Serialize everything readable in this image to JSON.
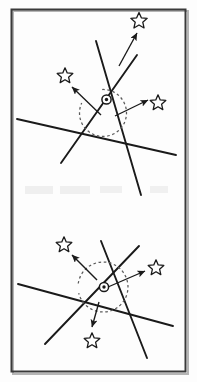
{
  "figure": {
    "canvas": {
      "width": 197,
      "height": 382
    },
    "background_color": "#fdfdfd",
    "stroke_color": "#1a1a1a",
    "frame": {
      "label": "outer-frame",
      "x": 11,
      "y": 9,
      "width": 175,
      "height": 363,
      "border_color": "#3a3a3a",
      "border_width": 2,
      "shadow_color": "#9a9a9a"
    },
    "panels": [
      {
        "name": "top-panel",
        "center_marker": {
          "label": "center-point-top",
          "cx": 106.5,
          "cy": 99.5,
          "outer_radius": 4.6,
          "inner_radius": 1.7
        },
        "dashed_arc": {
          "label": "dashed-circle-top",
          "cx": 103,
          "cy": 113,
          "radius": 23.5,
          "dash": "2.6 2.6",
          "color": "#5a5a5a",
          "start_angle_deg": -92,
          "end_angle_deg": 205
        },
        "lines": [
          {
            "label": "line-a",
            "x1": 96,
            "y1": 41,
            "x2": 141,
            "y2": 195
          },
          {
            "label": "line-b",
            "x1": 137,
            "y1": 55,
            "x2": 61,
            "y2": 163
          },
          {
            "label": "line-c",
            "x1": 17,
            "y1": 119,
            "x2": 176,
            "y2": 155
          }
        ],
        "arrows": [
          {
            "label": "arrow-up",
            "x1": 119,
            "y1": 66,
            "x2": 137,
            "y2": 33
          },
          {
            "label": "arrow-upleft",
            "x1": 101,
            "y1": 115,
            "x2": 72,
            "y2": 87
          },
          {
            "label": "arrow-right",
            "x1": 115,
            "y1": 116,
            "x2": 148,
            "y2": 100
          }
        ],
        "stars": [
          {
            "label": "star-top",
            "cx": 139,
            "cy": 21,
            "radius": 8.6
          },
          {
            "label": "star-upper-left",
            "cx": 65,
            "cy": 76,
            "radius": 8.2
          },
          {
            "label": "star-right",
            "cx": 158,
            "cy": 103,
            "radius": 8.2
          }
        ]
      },
      {
        "name": "bottom-panel",
        "center_marker": {
          "label": "center-point-bottom",
          "cx": 104,
          "cy": 287,
          "outer_radius": 4.6,
          "inner_radius": 1.7
        },
        "dashed_arc": {
          "label": "dashed-circle-bottom",
          "cx": 103,
          "cy": 287,
          "radius": 25,
          "dash": "2.6 2.6",
          "color": "#5a5a5a",
          "start_angle_deg": -172,
          "end_angle_deg": 166
        },
        "lines": [
          {
            "label": "line-a",
            "x1": 101,
            "y1": 241,
            "x2": 147,
            "y2": 358
          },
          {
            "label": "line-b",
            "x1": 139,
            "y1": 246,
            "x2": 45,
            "y2": 344
          },
          {
            "label": "line-c",
            "x1": 18,
            "y1": 284,
            "x2": 173,
            "y2": 326
          }
        ],
        "arrows": [
          {
            "label": "arrow-upleft",
            "x1": 97,
            "y1": 280,
            "x2": 72,
            "y2": 255
          },
          {
            "label": "arrow-right",
            "x1": 108,
            "y1": 287,
            "x2": 145,
            "y2": 271
          },
          {
            "label": "arrow-down",
            "x1": 99,
            "y1": 302,
            "x2": 92,
            "y2": 327
          }
        ],
        "stars": [
          {
            "label": "star-upper-left",
            "cx": 64,
            "cy": 245,
            "radius": 8.2
          },
          {
            "label": "star-right",
            "cx": 156,
            "cy": 268,
            "radius": 8.2
          },
          {
            "label": "star-bottom",
            "cx": 92,
            "cy": 341,
            "radius": 8.2
          }
        ]
      }
    ],
    "ghost_artifacts": [
      {
        "label": "scan-ghost-1",
        "x": 25,
        "y": 186,
        "width": 28,
        "height": 8
      },
      {
        "label": "scan-ghost-2",
        "x": 60,
        "y": 186,
        "width": 30,
        "height": 8
      },
      {
        "label": "scan-ghost-3",
        "x": 100,
        "y": 186,
        "width": 22,
        "height": 7
      },
      {
        "label": "scan-ghost-4",
        "x": 150,
        "y": 186,
        "width": 18,
        "height": 7
      }
    ]
  }
}
